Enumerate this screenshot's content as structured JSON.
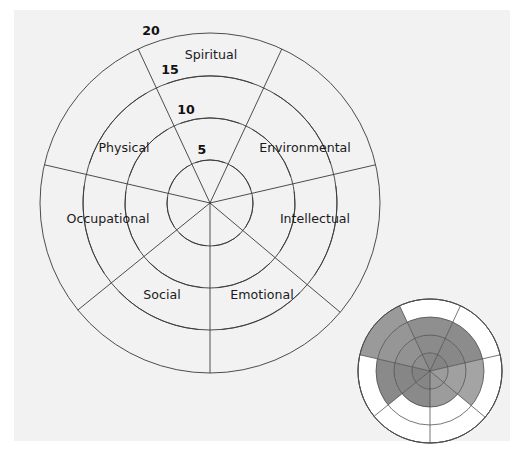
{
  "figure": {
    "background_color": "#f2f2f2",
    "line_color": "#3a3a3a",
    "text_color": "#1b1b1b"
  },
  "chart_data": {
    "type": "pie",
    "xlabel": "",
    "ylabel": "",
    "grid": true,
    "legend_position": "none",
    "axis_range": [
      0,
      20
    ],
    "tick_labels": [
      "5",
      "10",
      "15",
      "20"
    ],
    "tick_values": [
      5,
      10,
      15,
      20
    ],
    "categories": [
      "Spiritual",
      "Environmental",
      "Intellectual",
      "Emotional",
      "Social",
      "Occupational",
      "Physical"
    ],
    "series": [
      {
        "name": "Blank wheel (main)",
        "values": [
          0,
          0,
          0,
          0,
          0,
          0,
          0
        ]
      },
      {
        "name": "Completed example (inset)",
        "values": [
          15,
          15,
          15,
          10,
          10,
          15,
          20
        ]
      }
    ]
  },
  "main_wheel": {
    "name": "wellness-wheel-blank",
    "center": {
      "x": 210,
      "y": 203
    },
    "outer_radius": 170,
    "ring_radii": [
      43,
      85,
      127,
      170
    ],
    "sectors": [
      {
        "label": "Spiritual",
        "angle_start": -115,
        "angle_end": -65,
        "label_x": 211,
        "label_y": 59
      },
      {
        "label": "Environmental",
        "angle_start": -65,
        "angle_end": -13,
        "label_x": 305,
        "label_y": 152
      },
      {
        "label": "Intellectual",
        "angle_start": -13,
        "angle_end": 40,
        "label_x": 315,
        "label_y": 223
      },
      {
        "label": "Emotional",
        "angle_start": 40,
        "angle_end": 90,
        "label_x": 262,
        "label_y": 299
      },
      {
        "label": "Social",
        "angle_start": 90,
        "angle_end": 141,
        "label_x": 162,
        "label_y": 299
      },
      {
        "label": "Occupational",
        "angle_start": 141,
        "angle_end": 193,
        "label_x": 108,
        "label_y": 223
      },
      {
        "label": "Physical",
        "angle_start": 193,
        "angle_end": 245,
        "label_x": 124,
        "label_y": 152
      }
    ],
    "ticks": [
      {
        "label": "5",
        "x": 202,
        "y": 154
      },
      {
        "label": "10",
        "x": 186,
        "y": 114
      },
      {
        "label": "15",
        "x": 170,
        "y": 74
      },
      {
        "label": "20",
        "x": 151,
        "y": 35
      }
    ]
  },
  "inset_wheel": {
    "name": "wellness-wheel-completed-example",
    "center": {
      "x": 430,
      "y": 371
    },
    "outer_radius": 72,
    "ring_count": 4,
    "shade_colors": {
      "level_outer": "#a8a8a8",
      "level_mid": "#9a9a9a",
      "level_inner": "#8c8c8c",
      "level_core": "#7e7e7e",
      "empty": "#ffffff"
    },
    "sector_fill_levels": [
      {
        "label": "Spiritual",
        "filled_rings": 3,
        "shade": "#8f8f8f"
      },
      {
        "label": "Environmental",
        "filled_rings": 3,
        "shade": "#8c8c8c"
      },
      {
        "label": "Intellectual",
        "filled_rings": 3,
        "shade": "#a4a4a4"
      },
      {
        "label": "Emotional",
        "filled_rings": 2,
        "shade": "#9c9c9c"
      },
      {
        "label": "Social",
        "filled_rings": 2,
        "shade": "#8a8a8a"
      },
      {
        "label": "Occupational",
        "filled_rings": 3,
        "shade": "#8a8a8a"
      },
      {
        "label": "Physical",
        "filled_rings": 4,
        "shade": "#9a9a9a"
      }
    ]
  }
}
